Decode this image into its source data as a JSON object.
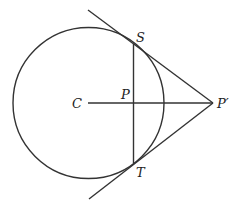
{
  "diagram": {
    "labels": {
      "center": "C",
      "midpoint": "P",
      "tangent_top": "S",
      "tangent_bottom": "T",
      "external_point": "P′"
    },
    "colors": {
      "stroke": "#333333",
      "background": "#ffffff"
    },
    "circle": {
      "cx": 88,
      "cy": 103,
      "r": 75
    }
  }
}
